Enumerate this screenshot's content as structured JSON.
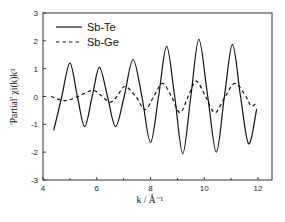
{
  "chart_data": {
    "type": "line",
    "title": "",
    "xlabel": "k / Å⁻¹",
    "ylabel": "'Partial' χi(k)k³",
    "xlim": [
      4,
      12
    ],
    "ylim": [
      -3,
      3
    ],
    "xticks": [
      4,
      6,
      8,
      10,
      12
    ],
    "xticks_minor": [
      5,
      7,
      9,
      11
    ],
    "yticks": [
      3,
      2,
      1,
      0,
      -1,
      -2,
      -3
    ],
    "grid": false,
    "legend_position": "upper left",
    "legend": [
      "Sb-Te",
      "Sb-Ge"
    ],
    "series": [
      {
        "name": "Sb-Te",
        "style": "solid",
        "points": [
          [
            4.4,
            -1.22
          ],
          [
            4.7,
            0.0
          ],
          [
            5.0,
            1.2
          ],
          [
            5.28,
            0.0
          ],
          [
            5.55,
            -1.08
          ],
          [
            5.83,
            0.0
          ],
          [
            6.1,
            1.05
          ],
          [
            6.4,
            0.0
          ],
          [
            6.7,
            -1.08
          ],
          [
            7.02,
            0.0
          ],
          [
            7.35,
            1.33
          ],
          [
            7.68,
            0.0
          ],
          [
            8.0,
            -1.65
          ],
          [
            8.3,
            0.0
          ],
          [
            8.6,
            1.8
          ],
          [
            8.9,
            0.0
          ],
          [
            9.2,
            -2.05
          ],
          [
            9.5,
            0.0
          ],
          [
            9.8,
            2.05
          ],
          [
            10.13,
            0.0
          ],
          [
            10.45,
            -2.0
          ],
          [
            10.75,
            0.0
          ],
          [
            11.05,
            1.87
          ],
          [
            11.35,
            0.0
          ],
          [
            11.65,
            -1.7
          ],
          [
            11.95,
            -0.45
          ]
        ]
      },
      {
        "name": "Sb-Ge",
        "style": "dashed",
        "points": [
          [
            4.3,
            0.0
          ],
          [
            4.8,
            -0.15
          ],
          [
            5.3,
            0.0
          ],
          [
            5.85,
            0.22
          ],
          [
            6.2,
            0.0
          ],
          [
            6.5,
            -0.2
          ],
          [
            6.75,
            0.0
          ],
          [
            7.05,
            0.36
          ],
          [
            7.45,
            0.0
          ],
          [
            7.8,
            -0.47
          ],
          [
            8.12,
            0.0
          ],
          [
            8.45,
            0.47
          ],
          [
            8.78,
            0.0
          ],
          [
            9.1,
            -0.58
          ],
          [
            9.4,
            0.0
          ],
          [
            9.7,
            0.55
          ],
          [
            10.05,
            0.0
          ],
          [
            10.4,
            -0.58
          ],
          [
            10.78,
            0.0
          ],
          [
            11.15,
            0.47
          ],
          [
            11.55,
            0.0
          ],
          [
            11.75,
            -0.35
          ],
          [
            11.95,
            -0.2
          ]
        ]
      }
    ]
  }
}
